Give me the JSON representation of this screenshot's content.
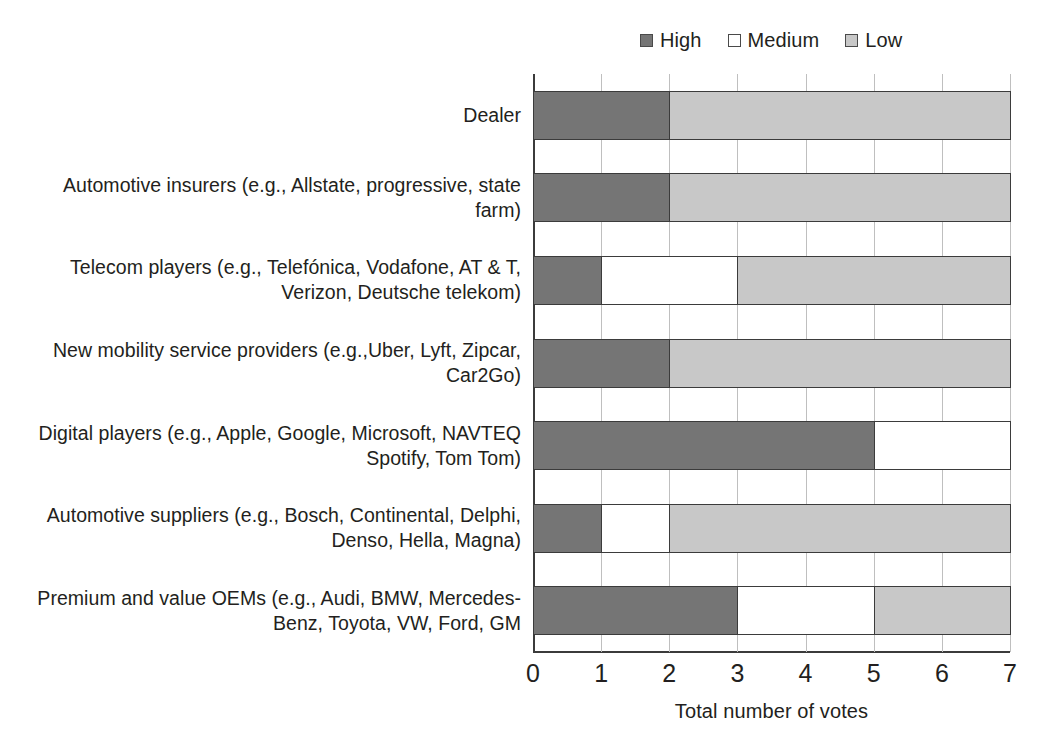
{
  "legend": {
    "items": [
      {
        "label": "High",
        "swatch": "legend-swatch-high",
        "color": "#757575"
      },
      {
        "label": "Medium",
        "swatch": "legend-swatch-medium",
        "color": "#ffffff"
      },
      {
        "label": "Low",
        "swatch": "legend-swatch-low",
        "color": "#c8c8c8"
      }
    ]
  },
  "axis": {
    "x_title": "Total number of votes",
    "x_ticks": [
      "0",
      "1",
      "2",
      "3",
      "4",
      "5",
      "6",
      "7"
    ]
  },
  "categories": [
    "Dealer",
    "Automotive insurers (e.g., Allstate, progressive, state farm)",
    "Telecom players (e.g., Telefónica, Vodafone, AT & T, Verizon, Deutsche telekom)",
    "New mobility service providers (e.g.,Uber, Lyft, Zipcar, Car2Go)",
    "Digital players (e.g., Apple, Google, Microsoft, NAVTEQ Spotify, Tom Tom)",
    "Automotive suppliers (e.g., Bosch, Continental, Delphi, Denso, Hella, Magna)",
    "Premium and value OEMs (e.g., Audi, BMW, Mercedes-Benz, Toyota, VW, Ford, GM"
  ],
  "chart_data": {
    "type": "bar",
    "orientation": "horizontal",
    "stacked": true,
    "title": "",
    "xlabel": "Total number of votes",
    "ylabel": "",
    "xlim": [
      0,
      7
    ],
    "xticks": [
      0,
      1,
      2,
      3,
      4,
      5,
      6,
      7
    ],
    "grid": true,
    "legend_position": "top-right",
    "categories": [
      "Dealer",
      "Automotive insurers (e.g., Allstate, progressive, state farm)",
      "Telecom players (e.g., Telefónica, Vodafone, AT & T, Verizon, Deutsche telekom)",
      "New mobility service providers (e.g.,Uber, Lyft, Zipcar, Car2Go)",
      "Digital players (e.g., Apple, Google, Microsoft, NAVTEQ Spotify, Tom Tom)",
      "Automotive suppliers (e.g., Bosch, Continental, Delphi, Denso, Hella, Magna)",
      "Premium and value OEMs (e.g., Audi, BMW, Mercedes-Benz, Toyota, VW, Ford, GM"
    ],
    "series": [
      {
        "name": "High",
        "color": "#757575",
        "values": [
          2,
          2,
          1,
          2,
          5,
          1,
          3
        ]
      },
      {
        "name": "Medium",
        "color": "#ffffff",
        "values": [
          0,
          0,
          2,
          0,
          2,
          1,
          2
        ]
      },
      {
        "name": "Low",
        "color": "#c8c8c8",
        "values": [
          5,
          5,
          4,
          5,
          0,
          5,
          2
        ]
      }
    ],
    "totals": [
      7,
      7,
      7,
      7,
      7,
      7,
      7
    ]
  }
}
